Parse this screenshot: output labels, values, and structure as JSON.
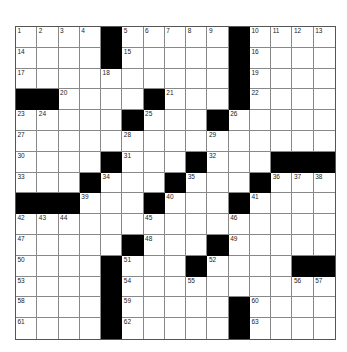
{
  "puzzle": {
    "rows": 15,
    "cols": 15,
    "grid": [
      [
        "1",
        "2",
        "3",
        "4",
        "#",
        "5",
        "6",
        "7",
        "8",
        "9",
        "#",
        "10",
        "11",
        "12",
        "13"
      ],
      [
        "14",
        "",
        "",
        "",
        "#",
        "15",
        "",
        "",
        "",
        "",
        "#",
        "16",
        "",
        "",
        ""
      ],
      [
        "17",
        "",
        "",
        "",
        "18",
        "",
        "",
        "",
        "",
        "",
        "#",
        "19",
        "",
        "",
        ""
      ],
      [
        "#",
        "#",
        "20",
        "",
        "",
        "",
        "#",
        "21",
        "",
        "",
        "#",
        "22",
        "",
        "",
        ""
      ],
      [
        "23",
        "24",
        "",
        "",
        "",
        "#",
        "25",
        "",
        "",
        "#",
        "26",
        "",
        "",
        "",
        ""
      ],
      [
        "27",
        "",
        "",
        "",
        "",
        "28",
        "",
        "",
        "",
        "29",
        "",
        "",
        "",
        "",
        ""
      ],
      [
        "30",
        "",
        "",
        "",
        "#",
        "31",
        "",
        "",
        "#",
        "32",
        "",
        "",
        "#",
        "#",
        "#"
      ],
      [
        "33",
        "",
        "",
        "#",
        "34",
        "",
        "",
        "#",
        "35",
        "",
        "",
        "#",
        "36",
        "37",
        "38"
      ],
      [
        "#",
        "#",
        "#",
        "39",
        "",
        "",
        "#",
        "40",
        "",
        "",
        "#",
        "41",
        "",
        "",
        ""
      ],
      [
        "42",
        "43",
        "44",
        "",
        "",
        "",
        "45",
        "",
        "",
        "",
        "46",
        "",
        "",
        "",
        ""
      ],
      [
        "47",
        "",
        "",
        "",
        "",
        "#",
        "48",
        "",
        "",
        "#",
        "49",
        "",
        "",
        "",
        ""
      ],
      [
        "50",
        "",
        "",
        "",
        "#",
        "51",
        "",
        "",
        "#",
        "52",
        "",
        "",
        "",
        "#",
        "#"
      ],
      [
        "53",
        "",
        "",
        "",
        "#",
        "54",
        "",
        "",
        "55",
        "",
        "",
        "",
        "",
        "56",
        "57"
      ],
      [
        "58",
        "",
        "",
        "",
        "#",
        "59",
        "",
        "",
        "",
        "",
        "#",
        "60",
        "",
        "",
        ""
      ],
      [
        "61",
        "",
        "",
        "",
        "#",
        "62",
        "",
        "",
        "",
        "",
        "#",
        "63",
        "",
        "",
        ""
      ]
    ],
    "colors": {
      "block": "#000000",
      "cell": "#ffffff",
      "line": "#888888",
      "number": "#222222"
    }
  }
}
